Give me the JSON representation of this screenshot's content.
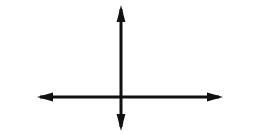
{
  "figure": {
    "title": "",
    "canvas": {
      "width": 255,
      "height": 134
    },
    "background_color": "#ffffff",
    "stroke_color": "#111111",
    "stroke_width": 3
  },
  "chart_data": {
    "type": "line",
    "title": "",
    "subtitle": "",
    "xlabel": "",
    "ylabel": "",
    "grid": false,
    "legend_position": "none",
    "tick_labels": {
      "x": [],
      "y": []
    },
    "annotations": [],
    "series": [
      {
        "name": "x-axis",
        "orientation": "horizontal",
        "arrowheads": "both",
        "x": [
          37,
          223
        ],
        "y": [
          97,
          97
        ]
      },
      {
        "name": "y-axis",
        "orientation": "vertical",
        "arrowheads": "both",
        "x": [
          121,
          121
        ],
        "y": [
          5,
          131
        ]
      }
    ],
    "origin": {
      "x": 121,
      "y": 97
    },
    "xlim": [
      37,
      223
    ],
    "ylim": [
      5,
      131
    ]
  },
  "elements": {
    "x_axis_label": "x-axis",
    "y_axis_label": "y-axis",
    "origin_label": "origin",
    "arrow_up_label": "up arrowhead",
    "arrow_down_label": "down arrowhead",
    "arrow_left_label": "left arrowhead",
    "arrow_right_label": "right arrowhead"
  }
}
